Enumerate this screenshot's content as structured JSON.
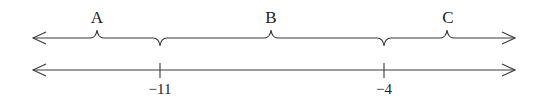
{
  "diagram": {
    "type": "number-line-regions",
    "regions": [
      {
        "label": "A",
        "description": "x < -11",
        "peak_x": 97
      },
      {
        "label": "B",
        "description": "-11 < x < -4",
        "peak_x": 271
      },
      {
        "label": "C",
        "description": "x > -4",
        "peak_x": 447
      }
    ],
    "ticks": [
      {
        "label": "−11",
        "value": -11,
        "x": 160
      },
      {
        "label": "−4",
        "value": -4,
        "x": 384
      }
    ],
    "colors": {
      "line": "#3a3a3a",
      "text": "#222222"
    }
  }
}
